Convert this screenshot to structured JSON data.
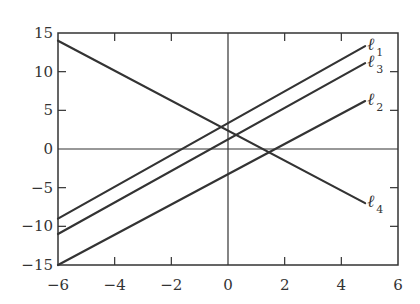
{
  "chart_data": {
    "type": "line",
    "title": "",
    "xlabel": "",
    "ylabel": "",
    "xlim": [
      -6,
      6
    ],
    "ylim": [
      -15,
      15
    ],
    "xticks": [
      -6,
      -4,
      -2,
      0,
      2,
      4,
      6
    ],
    "yticks": [
      -15,
      -10,
      -5,
      0,
      5,
      10,
      15
    ],
    "xtick_labels": [
      "−6",
      "−4",
      "−2",
      "0",
      "2",
      "4",
      "6"
    ],
    "ytick_labels": [
      "−15",
      "−10",
      "−5",
      "0",
      "5",
      "10",
      "15"
    ],
    "grid": false,
    "axes_lines": {
      "x0": true,
      "y0": true
    },
    "series": [
      {
        "name": "ℓ1",
        "label": "ℓ",
        "subscript": "1",
        "x": [
          -6,
          4.84
        ],
        "y": [
          -9,
          13.3
        ],
        "approx_equation": "y = 2x + 3"
      },
      {
        "name": "ℓ3",
        "label": "ℓ",
        "subscript": "3",
        "x": [
          -6,
          4.84
        ],
        "y": [
          -11,
          11.1
        ],
        "approx_equation": "y = 2x + 1"
      },
      {
        "name": "ℓ2",
        "label": "ℓ",
        "subscript": "2",
        "x": [
          -6,
          4.84
        ],
        "y": [
          -15,
          6.2
        ],
        "approx_equation": "y = 2x - 3"
      },
      {
        "name": "ℓ4",
        "label": "ℓ",
        "subscript": "4",
        "x": [
          -6,
          4.84
        ],
        "y": [
          14,
          -7
        ],
        "approx_equation": "y = -2x + 2"
      }
    ],
    "line_color": "#333333"
  }
}
